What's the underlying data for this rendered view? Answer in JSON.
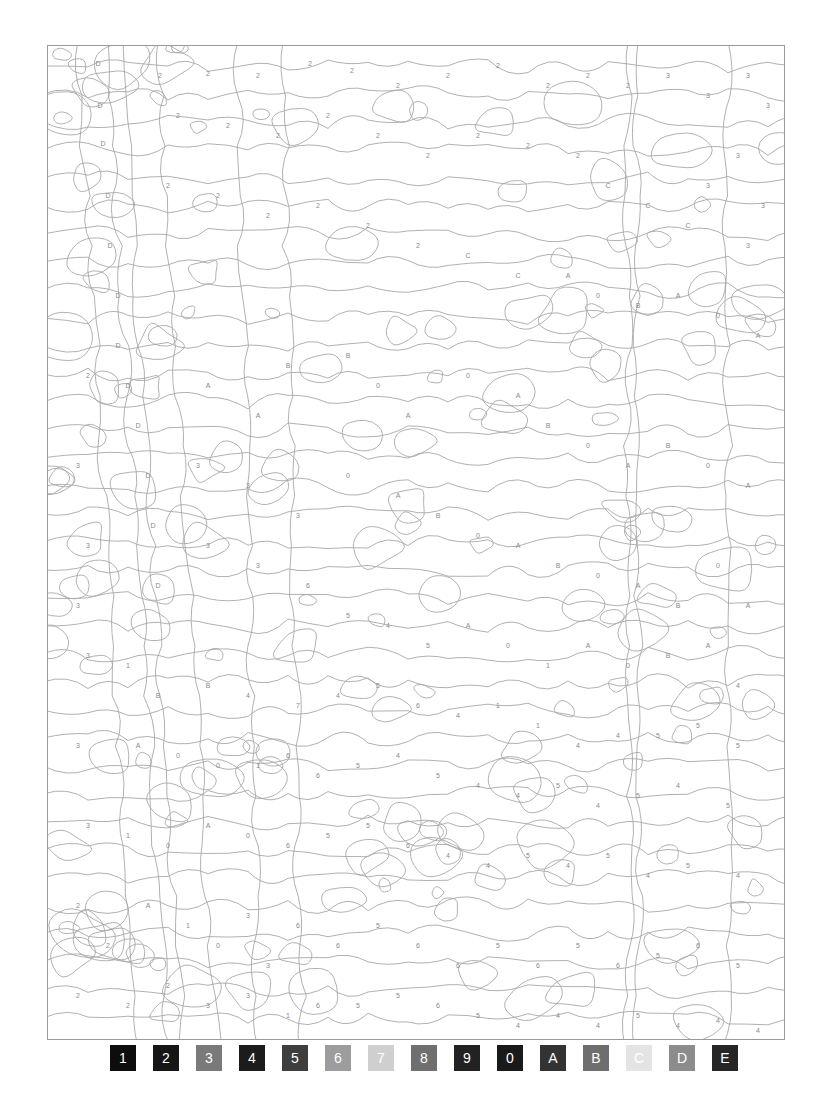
{
  "page": {
    "type": "color-by-number",
    "frame_color": "#9a9a9a",
    "line_color": "#a8a8a8",
    "label_color": "#8a8a8a"
  },
  "legend": [
    {
      "key": "1",
      "color": "#0d0d0d"
    },
    {
      "key": "2",
      "color": "#161616"
    },
    {
      "key": "3",
      "color": "#7a7a7a"
    },
    {
      "key": "4",
      "color": "#1c1c1c"
    },
    {
      "key": "5",
      "color": "#3e3e3e"
    },
    {
      "key": "6",
      "color": "#9d9d9d"
    },
    {
      "key": "7",
      "color": "#cfcfcf"
    },
    {
      "key": "8",
      "color": "#6f6f6f"
    },
    {
      "key": "9",
      "color": "#222222"
    },
    {
      "key": "0",
      "color": "#1a1a1a"
    },
    {
      "key": "A",
      "color": "#333333"
    },
    {
      "key": "B",
      "color": "#6e6e6e"
    },
    {
      "key": "C",
      "color": "#e4e4e4"
    },
    {
      "key": "D",
      "color": "#8c8c8c"
    },
    {
      "key": "E",
      "color": "#262626"
    }
  ],
  "regions": {
    "top_left_trunk": "D",
    "sky_top": "2",
    "top_right": "3",
    "upper_center_right": "C",
    "center_band": "A",
    "center_detail": "0",
    "center_detail_b": "B",
    "left_mid": "3",
    "center_left_streaks": "4",
    "center_left_streaks_b": "5",
    "bottom_left_foreground": "2",
    "bottom_left_mid": "3",
    "bottom_center_right": "6",
    "bottom_right": "5",
    "bottom_right_edge": "4",
    "lower_left_object": "0",
    "lower_left_object_b": "A",
    "lower_left_object_c": "1"
  },
  "labels": [
    [
      "D",
      50,
      18
    ],
    [
      "D",
      52,
      60
    ],
    [
      "D",
      55,
      98
    ],
    [
      "2",
      112,
      30
    ],
    [
      "2",
      160,
      28
    ],
    [
      "2",
      210,
      30
    ],
    [
      "2",
      262,
      18
    ],
    [
      "2",
      304,
      25
    ],
    [
      "2",
      350,
      40
    ],
    [
      "2",
      400,
      30
    ],
    [
      "2",
      450,
      20
    ],
    [
      "2",
      500,
      40
    ],
    [
      "2",
      540,
      30
    ],
    [
      "2",
      580,
      40
    ],
    [
      "3",
      620,
      30
    ],
    [
      "3",
      660,
      50
    ],
    [
      "3",
      700,
      30
    ],
    [
      "3",
      720,
      60
    ],
    [
      "3",
      690,
      110
    ],
    [
      "3",
      715,
      160
    ],
    [
      "2",
      130,
      70
    ],
    [
      "2",
      180,
      80
    ],
    [
      "2",
      230,
      90
    ],
    [
      "2",
      280,
      70
    ],
    [
      "2",
      330,
      90
    ],
    [
      "2",
      380,
      110
    ],
    [
      "2",
      430,
      90
    ],
    [
      "2",
      480,
      100
    ],
    [
      "2",
      530,
      110
    ],
    [
      "C",
      560,
      140
    ],
    [
      "C",
      600,
      160
    ],
    [
      "C",
      640,
      180
    ],
    [
      "3",
      660,
      140
    ],
    [
      "3",
      700,
      200
    ],
    [
      "D",
      60,
      150
    ],
    [
      "D",
      62,
      200
    ],
    [
      "D",
      70,
      250
    ],
    [
      "2",
      120,
      140
    ],
    [
      "2",
      170,
      150
    ],
    [
      "2",
      220,
      170
    ],
    [
      "2",
      270,
      160
    ],
    [
      "2",
      320,
      180
    ],
    [
      "2",
      370,
      200
    ],
    [
      "C",
      420,
      210
    ],
    [
      "C",
      470,
      230
    ],
    [
      "A",
      520,
      230
    ],
    [
      "0",
      550,
      250
    ],
    [
      "B",
      590,
      260
    ],
    [
      "A",
      630,
      250
    ],
    [
      "0",
      670,
      270
    ],
    [
      "A",
      710,
      290
    ],
    [
      "D",
      70,
      300
    ],
    [
      "D",
      80,
      340
    ],
    [
      "D",
      90,
      380
    ],
    [
      "2",
      40,
      330
    ],
    [
      "B",
      240,
      320
    ],
    [
      "B",
      300,
      310
    ],
    [
      "A",
      160,
      340
    ],
    [
      "A",
      210,
      370
    ],
    [
      "0",
      330,
      340
    ],
    [
      "A",
      360,
      370
    ],
    [
      "0",
      420,
      330
    ],
    [
      "A",
      470,
      350
    ],
    [
      "B",
      500,
      380
    ],
    [
      "0",
      540,
      400
    ],
    [
      "A",
      580,
      420
    ],
    [
      "B",
      620,
      400
    ],
    [
      "0",
      660,
      420
    ],
    [
      "A",
      700,
      440
    ],
    [
      "3",
      30,
      420
    ],
    [
      "D",
      100,
      430
    ],
    [
      "D",
      105,
      480
    ],
    [
      "3",
      150,
      420
    ],
    [
      "3",
      200,
      440
    ],
    [
      "3",
      250,
      470
    ],
    [
      "0",
      300,
      430
    ],
    [
      "A",
      350,
      450
    ],
    [
      "B",
      390,
      470
    ],
    [
      "0",
      430,
      490
    ],
    [
      "A",
      470,
      500
    ],
    [
      "B",
      510,
      520
    ],
    [
      "0",
      550,
      530
    ],
    [
      "A",
      590,
      540
    ],
    [
      "B",
      630,
      560
    ],
    [
      "0",
      670,
      520
    ],
    [
      "A",
      700,
      560
    ],
    [
      "3",
      40,
      500
    ],
    [
      "3",
      30,
      560
    ],
    [
      "D",
      110,
      540
    ],
    [
      "3",
      160,
      500
    ],
    [
      "3",
      210,
      520
    ],
    [
      "6",
      260,
      540
    ],
    [
      "5",
      300,
      570
    ],
    [
      "4",
      340,
      580
    ],
    [
      "5",
      380,
      600
    ],
    [
      "A",
      420,
      580
    ],
    [
      "0",
      460,
      600
    ],
    [
      "1",
      500,
      620
    ],
    [
      "A",
      540,
      600
    ],
    [
      "0",
      580,
      620
    ],
    [
      "B",
      620,
      610
    ],
    [
      "A",
      660,
      600
    ],
    [
      "4",
      690,
      640
    ],
    [
      "3",
      40,
      610
    ],
    [
      "1",
      80,
      620
    ],
    [
      "B",
      110,
      650
    ],
    [
      "B",
      160,
      640
    ],
    [
      "4",
      200,
      650
    ],
    [
      "7",
      250,
      660
    ],
    [
      "4",
      290,
      650
    ],
    [
      "5",
      330,
      640
    ],
    [
      "6",
      370,
      660
    ],
    [
      "4",
      410,
      670
    ],
    [
      "1",
      450,
      660
    ],
    [
      "1",
      490,
      680
    ],
    [
      "4",
      530,
      700
    ],
    [
      "4",
      570,
      690
    ],
    [
      "5",
      610,
      690
    ],
    [
      "5",
      650,
      680
    ],
    [
      "5",
      690,
      700
    ],
    [
      "3",
      30,
      700
    ],
    [
      "A",
      90,
      700
    ],
    [
      "0",
      130,
      710
    ],
    [
      "0",
      170,
      720
    ],
    [
      "1",
      210,
      720
    ],
    [
      "6",
      240,
      710
    ],
    [
      "6",
      270,
      730
    ],
    [
      "5",
      310,
      720
    ],
    [
      "4",
      350,
      710
    ],
    [
      "5",
      390,
      730
    ],
    [
      "4",
      430,
      740
    ],
    [
      "4",
      470,
      750
    ],
    [
      "5",
      510,
      740
    ],
    [
      "4",
      550,
      760
    ],
    [
      "5",
      590,
      750
    ],
    [
      "4",
      630,
      740
    ],
    [
      "5",
      680,
      760
    ],
    [
      "3",
      40,
      780
    ],
    [
      "1",
      80,
      790
    ],
    [
      "0",
      120,
      800
    ],
    [
      "A",
      160,
      780
    ],
    [
      "0",
      200,
      790
    ],
    [
      "6",
      240,
      800
    ],
    [
      "5",
      280,
      790
    ],
    [
      "5",
      320,
      780
    ],
    [
      "6",
      360,
      800
    ],
    [
      "4",
      400,
      810
    ],
    [
      "4",
      440,
      820
    ],
    [
      "5",
      480,
      810
    ],
    [
      "4",
      520,
      820
    ],
    [
      "5",
      560,
      810
    ],
    [
      "4",
      600,
      830
    ],
    [
      "5",
      640,
      820
    ],
    [
      "4",
      690,
      830
    ],
    [
      "2",
      30,
      860
    ],
    [
      "2",
      60,
      900
    ],
    [
      "A",
      100,
      860
    ],
    [
      "1",
      140,
      880
    ],
    [
      "0",
      170,
      900
    ],
    [
      "3",
      200,
      870
    ],
    [
      "3",
      220,
      920
    ],
    [
      "6",
      250,
      880
    ],
    [
      "6",
      290,
      900
    ],
    [
      "5",
      330,
      880
    ],
    [
      "6",
      370,
      900
    ],
    [
      "6",
      410,
      920
    ],
    [
      "5",
      450,
      900
    ],
    [
      "6",
      490,
      920
    ],
    [
      "5",
      530,
      900
    ],
    [
      "6",
      570,
      920
    ],
    [
      "5",
      610,
      910
    ],
    [
      "6",
      650,
      900
    ],
    [
      "5",
      690,
      920
    ],
    [
      "2",
      30,
      950
    ],
    [
      "2",
      80,
      960
    ],
    [
      "2",
      120,
      940
    ],
    [
      "3",
      160,
      960
    ],
    [
      "3",
      200,
      950
    ],
    [
      "1",
      240,
      970
    ],
    [
      "6",
      270,
      960
    ],
    [
      "5",
      310,
      960
    ],
    [
      "5",
      350,
      950
    ],
    [
      "6",
      390,
      960
    ],
    [
      "5",
      430,
      970
    ],
    [
      "4",
      470,
      980
    ],
    [
      "4",
      510,
      970
    ],
    [
      "4",
      550,
      980
    ],
    [
      "5",
      590,
      970
    ],
    [
      "4",
      630,
      980
    ],
    [
      "4",
      670,
      975
    ],
    [
      "4",
      710,
      985
    ]
  ]
}
